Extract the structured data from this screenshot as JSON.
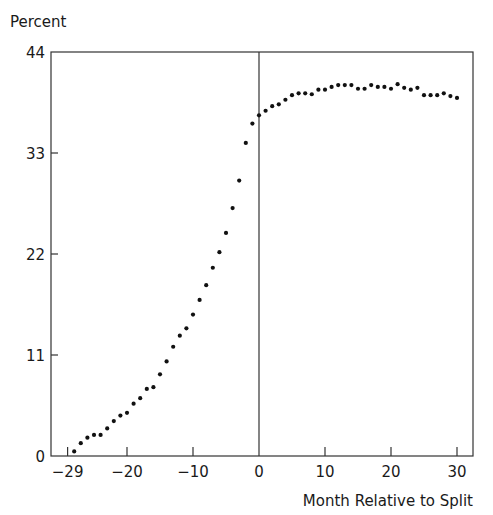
{
  "chart_data": {
    "type": "scatter",
    "title": "",
    "ylabel": "Percent",
    "xlabel": "Month Relative to Split",
    "xlim": [
      -31.2,
      32.4
    ],
    "ylim": [
      0,
      44
    ],
    "x_ticks": [
      -29,
      -20,
      -10,
      0,
      10,
      20,
      30
    ],
    "x_tick_labels": [
      "−29",
      "−20",
      "−10",
      "0",
      "10",
      "20",
      "30"
    ],
    "y_ticks": [
      0,
      11,
      22,
      33,
      44
    ],
    "y_tick_labels": [
      "0",
      "11",
      "22",
      "33",
      "44"
    ],
    "grid": false,
    "legend": null,
    "reference_line": {
      "x": 0,
      "orientation": "vertical"
    },
    "series": [
      {
        "name": "Percent",
        "x": [
          -28,
          -27,
          -26,
          -25,
          -24,
          -23,
          -22,
          -21,
          -20,
          -19,
          -18,
          -17,
          -16,
          -15,
          -14,
          -13,
          -12,
          -11,
          -10,
          -9,
          -8,
          -7,
          -6,
          -5,
          -4,
          -3,
          -2,
          -1,
          0,
          1,
          2,
          3,
          4,
          5,
          6,
          7,
          8,
          9,
          10,
          11,
          12,
          13,
          14,
          15,
          16,
          17,
          18,
          19,
          20,
          21,
          22,
          23,
          24,
          25,
          26,
          27,
          28,
          29,
          30
        ],
        "y": [
          0.5,
          1.4,
          2.0,
          2.3,
          2.3,
          3.0,
          3.8,
          4.4,
          4.7,
          5.7,
          6.3,
          7.3,
          7.5,
          8.9,
          10.3,
          11.9,
          13.1,
          13.9,
          15.4,
          17.0,
          18.6,
          20.5,
          22.2,
          24.3,
          27.0,
          30.0,
          34.1,
          36.2,
          37.1,
          37.6,
          38.1,
          38.3,
          38.8,
          39.3,
          39.5,
          39.5,
          39.4,
          39.9,
          39.9,
          40.2,
          40.4,
          40.4,
          40.4,
          40.0,
          40.0,
          40.4,
          40.2,
          40.2,
          40.0,
          40.5,
          40.1,
          39.9,
          40.1,
          39.3,
          39.3,
          39.3,
          39.5,
          39.2,
          39.0
        ]
      }
    ]
  }
}
